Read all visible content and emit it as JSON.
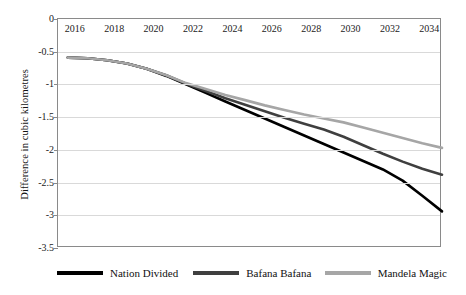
{
  "chart_data": {
    "type": "line",
    "title": "",
    "xlabel": "",
    "ylabel": "Difference in cubic kilometres",
    "xlim": [
      2015.5,
      2035
    ],
    "ylim": [
      -3.5,
      0
    ],
    "grid": true,
    "legend_position": "bottom",
    "x_tick_labels": [
      "2016",
      "2018",
      "2020",
      "2022",
      "2024",
      "2026",
      "2028",
      "2030",
      "2032",
      "2034"
    ],
    "x_ticks": [
      2016,
      2018,
      2020,
      2022,
      2024,
      2026,
      2028,
      2030,
      2032,
      2034
    ],
    "y_tick_labels": [
      "0",
      "-0.5",
      "-1",
      "-1.5",
      "-2",
      "-2.5",
      "-3",
      "-3.5"
    ],
    "y_ticks": [
      0,
      -0.5,
      -1,
      -1.5,
      -2,
      -2.5,
      -3,
      -3.5
    ],
    "x": [
      2016,
      2017,
      2018,
      2019,
      2020,
      2021,
      2022,
      2023,
      2024,
      2025,
      2026,
      2027,
      2028,
      2029,
      2030,
      2031,
      2032,
      2033,
      2034,
      2035
    ],
    "series": [
      {
        "name": "Nation Divided",
        "color": "#000000",
        "values": [
          -0.59,
          -0.6,
          -0.63,
          -0.68,
          -0.76,
          -0.87,
          -1.0,
          -1.13,
          -1.26,
          -1.39,
          -1.52,
          -1.65,
          -1.78,
          -1.91,
          -2.04,
          -2.17,
          -2.3,
          -2.47,
          -2.7,
          -2.94
        ]
      },
      {
        "name": "Bafana Bafana",
        "color": "#3f3f3f",
        "values": [
          -0.59,
          -0.6,
          -0.63,
          -0.68,
          -0.76,
          -0.86,
          -0.99,
          -1.1,
          -1.21,
          -1.31,
          -1.41,
          -1.51,
          -1.6,
          -1.69,
          -1.8,
          -1.93,
          -2.06,
          -2.18,
          -2.29,
          -2.38
        ]
      },
      {
        "name": "Mandela Magic",
        "color": "#a6a6a6",
        "values": [
          -0.59,
          -0.6,
          -0.63,
          -0.68,
          -0.76,
          -0.86,
          -0.98,
          -1.07,
          -1.16,
          -1.24,
          -1.32,
          -1.39,
          -1.46,
          -1.52,
          -1.58,
          -1.66,
          -1.74,
          -1.82,
          -1.9,
          -1.97
        ]
      }
    ]
  },
  "legend": {
    "items": [
      {
        "label": "Nation Divided",
        "color": "#000000"
      },
      {
        "label": "Bafana Bafana",
        "color": "#3f3f3f"
      },
      {
        "label": "Mandela Magic",
        "color": "#a6a6a6"
      }
    ]
  },
  "axis": {
    "y_title": "Difference in cubic kilometres"
  }
}
